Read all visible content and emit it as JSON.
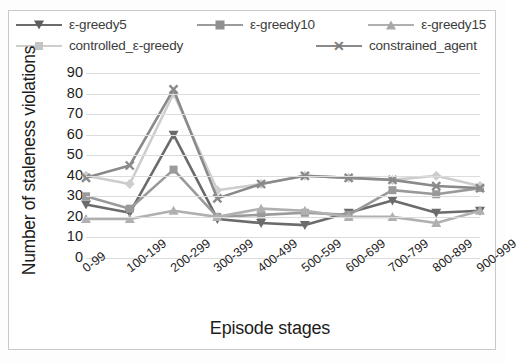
{
  "chart_data": {
    "type": "line",
    "title": "",
    "xlabel": "Episode stages",
    "ylabel": "Number of staleness violations",
    "ylim": [
      0,
      90
    ],
    "yticks": [
      90,
      80,
      70,
      60,
      50,
      40,
      30,
      20,
      10,
      0
    ],
    "grid": true,
    "legend_position": "top",
    "categories": [
      "0-99",
      "100-199",
      "200-299",
      "300-399",
      "400-499",
      "500-599",
      "600-699",
      "700-799",
      "800-899",
      "900-999"
    ],
    "series": [
      {
        "name": "ε-greedy5",
        "marker": "triangle-down",
        "color": "#6b6b6b",
        "values": [
          26,
          22,
          60,
          19,
          17,
          16,
          22,
          28,
          22,
          23
        ]
      },
      {
        "name": "ε-greedy10",
        "marker": "square",
        "color": "#9a9a9a",
        "values": [
          30,
          24,
          43,
          20,
          21,
          22,
          21,
          33,
          31,
          34
        ]
      },
      {
        "name": "ε-greedy15",
        "marker": "triangle-up",
        "color": "#b0b0b0",
        "values": [
          19,
          19,
          23,
          20,
          24,
          23,
          20,
          20,
          17,
          23
        ]
      },
      {
        "name": "controlled_ε-greedy",
        "marker": "diamond",
        "color": "#cdcdcd",
        "values": [
          40,
          36,
          80,
          33,
          36,
          40,
          39,
          38,
          40,
          35
        ]
      },
      {
        "name": "constrained_agent",
        "marker": "x",
        "color": "#8a8a8a",
        "values": [
          39,
          45,
          82,
          29,
          36,
          40,
          39,
          38,
          35,
          34
        ]
      }
    ]
  },
  "legend": {
    "rows": [
      [
        {
          "label": "ε-greedy5",
          "icon": "triangle-down-marker-icon"
        },
        {
          "label": "ε-greedy10",
          "icon": "square-marker-icon"
        },
        {
          "label": "ε-greedy15",
          "icon": "triangle-up-marker-icon"
        }
      ],
      [
        {
          "label": "controlled_ε-greedy",
          "icon": "diamond-marker-icon"
        },
        {
          "label": "constrained_agent",
          "icon": "x-marker-icon"
        }
      ]
    ]
  },
  "axis": {
    "y_title": "Number of staleness violations",
    "x_title": "Episode stages",
    "y_tick_labels": [
      "90",
      "80",
      "70",
      "60",
      "50",
      "40",
      "30",
      "20",
      "10",
      "0"
    ],
    "x_tick_labels": [
      "0-99",
      "100-199",
      "200-299",
      "300-399",
      "400-499",
      "500-599",
      "600-699",
      "700-799",
      "800-899",
      "900-999"
    ]
  },
  "x_marker_glyph": "✕"
}
